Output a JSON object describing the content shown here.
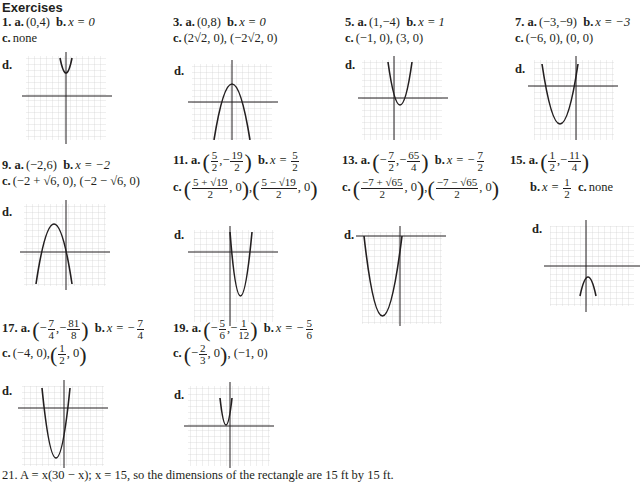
{
  "heading": "Exercises",
  "exercises": [
    {
      "num": "1.",
      "a": "(0,4)",
      "b": "x = 0",
      "c": "none"
    },
    {
      "num": "3.",
      "a": "(0,8)",
      "b": "x = 0",
      "c": "(2√2, 0), (−2√2, 0)"
    },
    {
      "num": "5.",
      "a": "(1,−4)",
      "b": "x = 1",
      "c": "(−1, 0), (3, 0)"
    },
    {
      "num": "7.",
      "a": "(−3,−9)",
      "b": "x = −3",
      "c": "(−6, 0), (0, 0)"
    },
    {
      "num": "9.",
      "a": "(−2,6)",
      "b": "x = −2",
      "c": "(−2 + √6, 0), (−2 − √6, 0)"
    },
    {
      "num": "11.",
      "a_parts": [
        "5",
        "2",
        "19",
        "2"
      ],
      "b_parts": [
        "5",
        "2"
      ],
      "c_parts": [
        "5 + √19",
        "2",
        "5 − √19",
        "2"
      ]
    },
    {
      "num": "13.",
      "a_parts": [
        "7",
        "2",
        "65",
        "4"
      ],
      "b_parts": [
        "7",
        "2"
      ],
      "c_parts": [
        "−7 + √65",
        "2",
        "−7 − √65",
        "2"
      ]
    },
    {
      "num": "15.",
      "a_parts": [
        "1",
        "2",
        "11",
        "4"
      ],
      "b_parts": [
        "1",
        "2"
      ],
      "c": "none"
    },
    {
      "num": "17.",
      "a_parts": [
        "7",
        "4",
        "81",
        "8"
      ],
      "b_parts": [
        "7",
        "4"
      ],
      "c_pre": "(−4, 0),",
      "c_parts": [
        "1",
        "2"
      ]
    },
    {
      "num": "19.",
      "a_parts": [
        "5",
        "6",
        "1",
        "12"
      ],
      "b_parts": [
        "5",
        "6"
      ],
      "c_parts": [
        "2",
        "3"
      ],
      "c_post": "(−1, 0)"
    }
  ],
  "labels": {
    "a": "a.",
    "b": "b.",
    "c": "c.",
    "d": "d.",
    "x": "x",
    "y": "y",
    "zero": "0",
    "comma": ",",
    "minus": "−",
    "eq": "x = ",
    "eqneg": "x = −"
  },
  "footer": "21. A = x(30 − x); x = 15, so the dimensions of the rectangle are 15 ft by 15 ft."
}
